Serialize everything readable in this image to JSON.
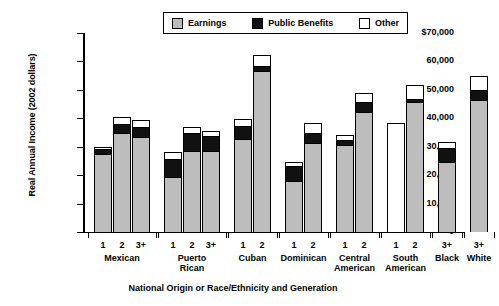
{
  "chart_data": {
    "type": "bar",
    "stacked": true,
    "title": "",
    "xlabel": "National Origin or Race/Ethnicity and Generation",
    "ylabel": "Real Annual Income (2002 dollars)",
    "ylim": [
      0,
      70000
    ],
    "ytick_labels": [
      "$70,000",
      "60,000",
      "50,000",
      "40,000",
      "30,000",
      "20,000",
      "10,000",
      "0"
    ],
    "ytick_values": [
      70000,
      60000,
      50000,
      40000,
      30000,
      20000,
      10000,
      0
    ],
    "grid": false,
    "legend_position": "top-center",
    "series": [
      {
        "name": "Earnings",
        "color": "#bdbdbd",
        "values": [
          27500,
          35000,
          33300,
          19300,
          28500,
          28600,
          32800,
          56500,
          17800,
          31300,
          30700,
          42300,
          0,
          45600,
          24800,
          46300
        ]
      },
      {
        "name": "Public Benefits",
        "color": "#111111",
        "values": [
          1700,
          3000,
          3700,
          6500,
          6500,
          5100,
          4500,
          2000,
          5300,
          3400,
          1800,
          3300,
          0,
          1100,
          4700,
          3800
        ]
      },
      {
        "name": "Other",
        "color": "#ffffff",
        "values": [
          800,
          2300,
          2300,
          2200,
          2000,
          1700,
          2500,
          3700,
          1400,
          3600,
          1500,
          3300,
          38300,
          5000,
          2300,
          4900
        ]
      }
    ],
    "bars": [
      {
        "group": "Mexican",
        "generation": "1",
        "earnings": 27500,
        "public_benefits": 1700,
        "other": 800,
        "total": 30000
      },
      {
        "group": "Mexican",
        "generation": "2",
        "earnings": 35000,
        "public_benefits": 3000,
        "other": 2300,
        "total": 40300
      },
      {
        "group": "Mexican",
        "generation": "3+",
        "earnings": 33300,
        "public_benefits": 3700,
        "other": 2300,
        "total": 39300
      },
      {
        "group": "Puerto Rican",
        "generation": "1",
        "earnings": 19300,
        "public_benefits": 6500,
        "other": 2200,
        "total": 28000
      },
      {
        "group": "Puerto Rican",
        "generation": "2",
        "earnings": 28500,
        "public_benefits": 6500,
        "other": 2000,
        "total": 37000
      },
      {
        "group": "Puerto Rican",
        "generation": "3+",
        "earnings": 28600,
        "public_benefits": 5100,
        "other": 1700,
        "total": 35400
      },
      {
        "group": "Cuban",
        "generation": "1",
        "earnings": 32800,
        "public_benefits": 4500,
        "other": 2500,
        "total": 39800
      },
      {
        "group": "Cuban",
        "generation": "2",
        "earnings": 56500,
        "public_benefits": 2000,
        "other": 3700,
        "total": 62200
      },
      {
        "group": "Dominican",
        "generation": "1",
        "earnings": 17800,
        "public_benefits": 5300,
        "other": 1400,
        "total": 24500
      },
      {
        "group": "Dominican",
        "generation": "2",
        "earnings": 31300,
        "public_benefits": 3400,
        "other": 3600,
        "total": 38300
      },
      {
        "group": "Central American",
        "generation": "1",
        "earnings": 30700,
        "public_benefits": 1800,
        "other": 1500,
        "total": 34000
      },
      {
        "group": "Central American",
        "generation": "2",
        "earnings": 42300,
        "public_benefits": 3300,
        "other": 3300,
        "total": 48900
      },
      {
        "group": "South American",
        "generation": "1",
        "earnings": 0,
        "public_benefits": 0,
        "other": 38300,
        "total": 38300
      },
      {
        "group": "South American",
        "generation": "2",
        "earnings": 45600,
        "public_benefits": 1100,
        "other": 5000,
        "total": 51700
      },
      {
        "group": "Black",
        "generation": "3+",
        "earnings": 24800,
        "public_benefits": 4700,
        "other": 2300,
        "total": 31800
      },
      {
        "group": "White",
        "generation": "3+",
        "earnings": 46300,
        "public_benefits": 3800,
        "other": 4900,
        "total": 55000
      }
    ],
    "groups": [
      {
        "label": "Mexican",
        "generations": [
          "1",
          "2",
          "3+"
        ]
      },
      {
        "label": "Puerto\nRican",
        "generations": [
          "1",
          "2",
          "3+"
        ]
      },
      {
        "label": "Cuban",
        "generations": [
          "1",
          "2"
        ]
      },
      {
        "label": "Dominican",
        "generations": [
          "1",
          "2"
        ]
      },
      {
        "label": "Central\nAmerican",
        "generations": [
          "1",
          "2"
        ]
      },
      {
        "label": "South\nAmerican",
        "generations": [
          "1",
          "2"
        ]
      },
      {
        "label": "Black",
        "generations": [
          "3+"
        ]
      },
      {
        "label": "White",
        "generations": [
          "3+"
        ]
      }
    ]
  },
  "legend": {
    "items": [
      {
        "label": "Earnings",
        "color": "#bdbdbd"
      },
      {
        "label": "Public Benefits",
        "color": "#111111"
      },
      {
        "label": "Other",
        "color": "#ffffff"
      }
    ]
  },
  "axes": {
    "y_title": "Real Annual Income (2002 dollars)",
    "x_title": "National Origin or Race/Ethnicity and Generation"
  }
}
